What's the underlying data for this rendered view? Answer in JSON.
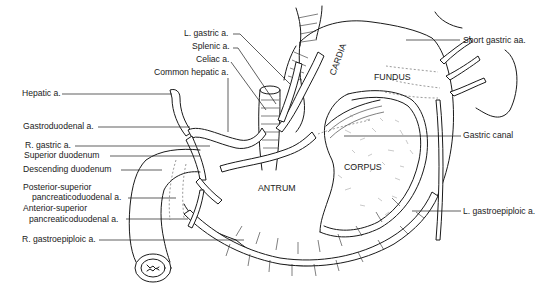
{
  "figure": {
    "type": "anatomical-illustration",
    "regions": [
      {
        "id": "cardia",
        "label": "CARDIA"
      },
      {
        "id": "fundus",
        "label": "FUNDUS"
      },
      {
        "id": "corpus",
        "label": "CORPUS"
      },
      {
        "id": "antrum",
        "label": "ANTRUM"
      }
    ],
    "left_labels": [
      {
        "id": "l-gastric",
        "label": "L. gastric a."
      },
      {
        "id": "splenic",
        "label": "Splenic a."
      },
      {
        "id": "celiac",
        "label": "Celiac a."
      },
      {
        "id": "common-hepatic",
        "label": "Common hepatic a."
      },
      {
        "id": "hepatic",
        "label": "Hepatic a."
      },
      {
        "id": "gastroduodenal",
        "label": "Gastroduodenal a."
      },
      {
        "id": "r-gastric",
        "label": "R. gastric a."
      },
      {
        "id": "superior-duodenum",
        "label": "Superior duodenum"
      },
      {
        "id": "descending-duodenum",
        "label": "Descending duodenum"
      },
      {
        "id": "post-sup-pd-1",
        "label": "Posterior-superior"
      },
      {
        "id": "post-sup-pd-2",
        "label": "pancreaticoduodenal a."
      },
      {
        "id": "ant-sup-pd-1",
        "label": "Anterior-superior"
      },
      {
        "id": "ant-sup-pd-2",
        "label": "pancreaticoduodenal a."
      },
      {
        "id": "r-gastroepiploic",
        "label": "R. gastroepiploic a."
      }
    ],
    "right_labels": [
      {
        "id": "short-gastric",
        "label": "Short gastric aa."
      },
      {
        "id": "gastric-canal",
        "label": "Gastric canal"
      },
      {
        "id": "l-gastroepiploic",
        "label": "L. gastroepiploic a."
      }
    ]
  }
}
